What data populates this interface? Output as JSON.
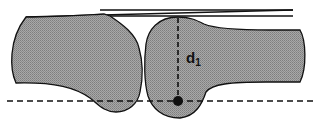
{
  "diagram": {
    "type": "joint-cross-section",
    "colors": {
      "bone_fill": "#9a9a9a",
      "outline": "#111111",
      "background": "#ffffff"
    },
    "labels": {
      "distance": "d",
      "distance_subscript": "1"
    },
    "elements": [
      "left-bone",
      "right-bone",
      "top-parallel-lines",
      "baseline-dashed",
      "vertical-dashed-measure",
      "contact-point"
    ]
  }
}
